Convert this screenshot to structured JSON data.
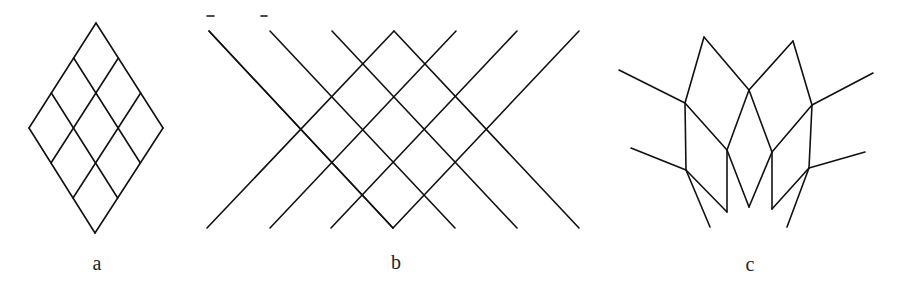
{
  "figure": {
    "stroke_color": "#111111",
    "background": "#ffffff",
    "panels": [
      {
        "id": "a",
        "label": "a",
        "label_pos": [
          97,
          263
        ],
        "description": "Rhombus subdivided into a 3x3 grid of smaller rhombi",
        "rhombus": {
          "top": [
            96,
            23
          ],
          "right": [
            163,
            128
          ],
          "bottom": [
            95,
            233
          ],
          "left": [
            29,
            128
          ]
        },
        "divisions": 3
      },
      {
        "id": "b",
        "label": "b",
        "label_pos": [
          396,
          262
        ],
        "description": "Crossing diagonal lines forming a lattice of rhombi",
        "top_y": 31,
        "bottom_y": 228,
        "top_x": [
          209,
          270,
          332,
          394,
          456,
          517,
          579
        ],
        "bottom_x": [
          207,
          270,
          331,
          393,
          455,
          517,
          579
        ],
        "marks": [
          [
            207,
            16,
            214,
            16
          ],
          [
            261,
            16,
            267,
            16
          ]
        ]
      },
      {
        "id": "c",
        "label": "c",
        "label_pos": [
          750,
          264
        ],
        "description": "Folded / deformed lattice",
        "segments": [
          [
            619,
            70,
            685,
            103
          ],
          [
            685,
            103,
            704,
            37
          ],
          [
            704,
            37,
            749,
            90
          ],
          [
            749,
            90,
            793,
            41
          ],
          [
            793,
            41,
            812,
            105
          ],
          [
            812,
            105,
            873,
            73
          ],
          [
            685,
            103,
            727,
            150
          ],
          [
            749,
            90,
            727,
            150
          ],
          [
            749,
            90,
            772,
            152
          ],
          [
            812,
            105,
            772,
            152
          ],
          [
            685,
            103,
            686,
            170
          ],
          [
            812,
            105,
            809,
            168
          ],
          [
            631,
            148,
            686,
            170
          ],
          [
            809,
            168,
            865,
            152
          ],
          [
            727,
            150,
            727,
            212
          ],
          [
            772,
            152,
            772,
            209
          ],
          [
            727,
            150,
            749,
            207
          ],
          [
            772,
            152,
            749,
            207
          ],
          [
            686,
            170,
            727,
            212
          ],
          [
            809,
            168,
            772,
            209
          ],
          [
            686,
            170,
            710,
            227
          ],
          [
            809,
            168,
            787,
            227
          ]
        ]
      }
    ]
  }
}
